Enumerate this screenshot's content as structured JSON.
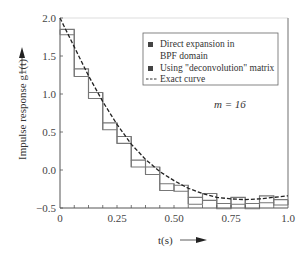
{
  "chart_data": {
    "type": "line",
    "title": "",
    "xlabel": "t(s)",
    "ylabel": "Impulse response g1(t)",
    "xlim": [
      0,
      1.0
    ],
    "ylim": [
      -0.5,
      2.0
    ],
    "x_ticks": [
      "0",
      "0.25",
      "0.50",
      "0.75",
      "1.0"
    ],
    "y_ticks": [
      "2.0",
      "1.5",
      "1.0",
      "0.5",
      "0.0",
      "−0.5"
    ],
    "grid": false,
    "annotation": "m = 16",
    "legend": {
      "position": "upper right",
      "entries": [
        {
          "label_line1": "Direct expansion in",
          "label_line2": "BPF domain",
          "marker": "square"
        },
        {
          "label_line1": "Using \"deconvolution\" matrix",
          "marker": "square"
        },
        {
          "label_line1": "Exact curve",
          "marker": "dashed-line"
        }
      ]
    },
    "intervals": 16,
    "series": [
      {
        "name": "Direct expansion in BPF domain",
        "style": "step",
        "x_edges": [
          0,
          0.0625,
          0.125,
          0.1875,
          0.25,
          0.3125,
          0.375,
          0.4375,
          0.5,
          0.5625,
          0.625,
          0.6875,
          0.75,
          0.8125,
          0.875,
          0.9375,
          1.0
        ],
        "values": [
          1.85,
          1.33,
          1.02,
          0.62,
          0.44,
          0.13,
          0.04,
          -0.18,
          -0.2,
          -0.36,
          -0.31,
          -0.44,
          -0.36,
          -0.44,
          -0.34,
          -0.39
        ]
      },
      {
        "name": "Using \"deconvolution\" matrix",
        "style": "step",
        "x_edges": [
          0,
          0.0625,
          0.125,
          0.1875,
          0.25,
          0.3125,
          0.375,
          0.4375,
          0.5,
          0.5625,
          0.625,
          0.6875,
          0.75,
          0.8125,
          0.875,
          0.9375,
          1.0
        ],
        "values": [
          1.78,
          1.23,
          0.94,
          0.53,
          0.35,
          0.04,
          -0.06,
          -0.27,
          -0.28,
          -0.45,
          -0.4,
          -0.51,
          -0.45,
          -0.51,
          -0.43,
          -0.46
        ]
      },
      {
        "name": "Exact curve",
        "style": "dashed",
        "x": [
          0,
          0.0625,
          0.125,
          0.1875,
          0.25,
          0.3125,
          0.375,
          0.4375,
          0.5,
          0.5625,
          0.625,
          0.6875,
          0.75,
          0.8125,
          0.875,
          0.9375,
          1.0
        ],
        "y": [
          2.0,
          1.62,
          1.24,
          0.9,
          0.6,
          0.34,
          0.14,
          -0.02,
          -0.14,
          -0.24,
          -0.31,
          -0.36,
          -0.38,
          -0.39,
          -0.38,
          -0.36,
          -0.34
        ]
      }
    ]
  }
}
